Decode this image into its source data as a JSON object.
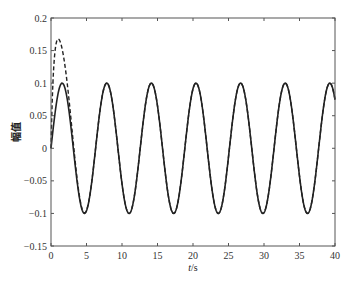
{
  "chart_data": {
    "type": "line",
    "title": "",
    "xlabel": "t/s",
    "xlabel_italic_part": "t",
    "xlabel_unit_part": "/s",
    "ylabel": "幅值",
    "xlim": [
      0,
      40
    ],
    "ylim": [
      -0.15,
      0.2
    ],
    "xticks": [
      0,
      5,
      10,
      15,
      20,
      25,
      30,
      35,
      40
    ],
    "xtick_labels": [
      "0",
      "5",
      "10",
      "15",
      "20",
      "25",
      "30",
      "35",
      "40"
    ],
    "yticks": [
      -0.15,
      -0.1,
      -0.05,
      0,
      0.05,
      0.1,
      0.15,
      0.2
    ],
    "ytick_labels": [
      "−0.15",
      "−0.1",
      "−0.05",
      "0",
      "0.05",
      "0.1",
      "0.15",
      "0.2"
    ],
    "grid": false,
    "legend": null,
    "series": [
      {
        "name": "reference (solid)",
        "style": "solid",
        "color": "#222222",
        "description": "y = 0.1·sin(t)",
        "x": [
          0,
          1.57,
          4.71,
          7.85,
          10.99,
          14.14,
          17.28,
          20.42,
          23.56,
          26.7,
          29.85,
          32.99,
          36.13,
          39.27,
          40
        ],
        "y": [
          0,
          0.1,
          -0.1,
          0.1,
          -0.1,
          0.1,
          -0.1,
          0.1,
          -0.1,
          0.1,
          -0.1,
          0.1,
          -0.1,
          0.1,
          0.075
        ]
      },
      {
        "name": "response (dashed)",
        "style": "dashed",
        "color": "#222222",
        "description": "starts at 0, overshoots to ~0.165 at t≈0.85, converges to solid curve by t≈2.5",
        "x": [
          0,
          0.2,
          0.4,
          0.6,
          0.85,
          1.1,
          1.4,
          1.7,
          2.0,
          2.3,
          2.6,
          4.71,
          7.85,
          10.99,
          14.14,
          17.28,
          20.42,
          23.56,
          26.7,
          29.85,
          32.99,
          36.13,
          39.27,
          40
        ],
        "y": [
          0,
          0.06,
          0.115,
          0.15,
          0.165,
          0.158,
          0.135,
          0.105,
          0.08,
          0.06,
          0.045,
          -0.1,
          0.1,
          -0.1,
          0.1,
          -0.1,
          0.1,
          -0.1,
          0.1,
          -0.1,
          0.1,
          -0.1,
          0.1,
          0.075
        ]
      }
    ]
  }
}
